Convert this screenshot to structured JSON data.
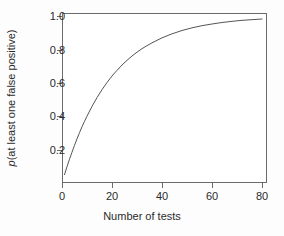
{
  "chart_data": {
    "type": "line",
    "title": "",
    "subtitle": "",
    "xlabel": "Number of tests",
    "ylabel_prefix": "p",
    "ylabel_rest": "(at least one false positive)",
    "ylabel": "p(at least one false positive)",
    "xlim": [
      0,
      82
    ],
    "ylim": [
      0.0,
      1.02
    ],
    "grid": false,
    "legend": null,
    "annotations": [],
    "xticks": [
      {
        "value": 0,
        "label": "0"
      },
      {
        "value": 20,
        "label": "20"
      },
      {
        "value": 40,
        "label": "40"
      },
      {
        "value": 60,
        "label": "60"
      },
      {
        "value": 80,
        "label": "80"
      }
    ],
    "yticks": [
      {
        "value": 0.2,
        "label": "0.2"
      },
      {
        "value": 0.4,
        "label": "0.4"
      },
      {
        "value": 0.6,
        "label": "0.6"
      },
      {
        "value": 0.8,
        "label": "0.8"
      },
      {
        "value": 1.0,
        "label": "1.0"
      }
    ],
    "series": [
      {
        "name": "p(at least one false positive)",
        "formula": "1 - 0.95^n",
        "color": "#555555",
        "linewidth": 1,
        "x": [
          1,
          2,
          3,
          4,
          5,
          6,
          7,
          8,
          9,
          10,
          12,
          14,
          16,
          18,
          20,
          22,
          24,
          26,
          28,
          30,
          32,
          34,
          36,
          38,
          40,
          44,
          48,
          52,
          56,
          60,
          64,
          68,
          72,
          76,
          80
        ],
        "values": [
          0.05,
          0.098,
          0.143,
          0.185,
          0.226,
          0.265,
          0.302,
          0.337,
          0.37,
          0.401,
          0.46,
          0.512,
          0.56,
          0.603,
          0.642,
          0.676,
          0.708,
          0.736,
          0.762,
          0.785,
          0.806,
          0.824,
          0.841,
          0.856,
          0.871,
          0.895,
          0.915,
          0.931,
          0.944,
          0.954,
          0.963,
          0.97,
          0.976,
          0.98,
          0.984
        ]
      }
    ]
  },
  "figure": {
    "background": "#fdfdfd",
    "plot_background": "#ffffff",
    "axis_color": "#6b6b6b",
    "text_color": "#2b2b2b"
  }
}
